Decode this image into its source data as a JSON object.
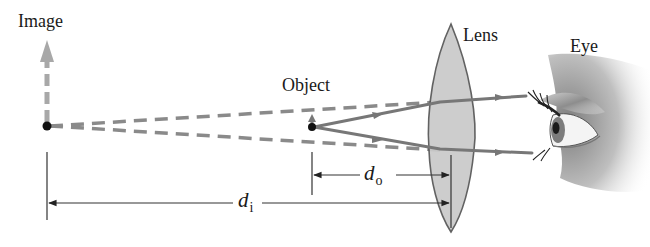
{
  "diagram": {
    "labels": {
      "image": "Image",
      "object": "Object",
      "lens": "Lens",
      "eye": "Eye",
      "d_o_symbol": "d",
      "d_o_subscript": "o",
      "d_i_symbol": "d",
      "d_i_subscript": "i"
    },
    "colors": {
      "ray": "#7a7a7a",
      "virtual_ray": "#8a8a8a",
      "image_arrow": "#a8a8a8",
      "lens_fill": "#c9c9c9",
      "lens_stroke": "#555555",
      "dimension_line": "#333333",
      "point": "#111111"
    },
    "elements": [
      {
        "id": "image-point",
        "type": "point",
        "desc": "Virtual image location, with upward gray dashed arrow"
      },
      {
        "id": "object-point",
        "type": "point",
        "desc": "Object located inside focal length, small upright arrow"
      },
      {
        "id": "lens",
        "type": "converging-lens"
      },
      {
        "id": "eye",
        "type": "illustration"
      },
      {
        "id": "real-rays",
        "type": "solid-rays",
        "count": 2,
        "desc": "Rays from object through lens into the eye"
      },
      {
        "id": "virtual-rays",
        "type": "dashed-rays",
        "count": 2,
        "desc": "Rays traced back to virtual image"
      },
      {
        "id": "d_o",
        "type": "dimension",
        "from": "object",
        "to": "lens"
      },
      {
        "id": "d_i",
        "type": "dimension",
        "from": "image",
        "to": "lens"
      }
    ]
  }
}
